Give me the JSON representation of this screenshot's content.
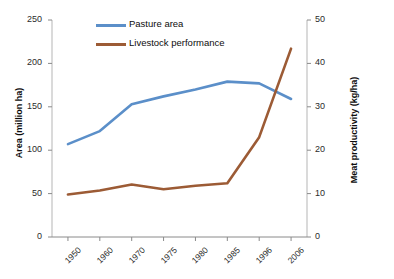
{
  "chart_data": {
    "type": "line",
    "title": "",
    "subtitle": "",
    "xlabel": "",
    "categories": [
      "1950",
      "1960",
      "1970",
      "1975",
      "1980",
      "1985",
      "1996",
      "2006"
    ],
    "grid": false,
    "legend_position": "top-center",
    "axes": {
      "left": {
        "label": "Area (million ha)",
        "ticks": [
          "0",
          "50",
          "100",
          "150",
          "200",
          "250"
        ],
        "min": 0,
        "max": 250,
        "step": 50
      },
      "right": {
        "label": "Meat productivity (kg/ha)",
        "ticks": [
          "0",
          "10",
          "20",
          "30",
          "40",
          "50"
        ],
        "min": 0,
        "max": 50,
        "step": 10
      }
    },
    "series": [
      {
        "name": "Pasture area",
        "axis": "left",
        "color": "#5B8FC9",
        "values": [
          107,
          122,
          153,
          162,
          170,
          179,
          177,
          159
        ]
      },
      {
        "name": "Livestock performance",
        "axis": "right",
        "color": "#9C5B35",
        "values": [
          9.8,
          10.7,
          12.1,
          11.0,
          11.8,
          12.4,
          23.0,
          43.4
        ]
      }
    ]
  },
  "legend": {
    "items": [
      {
        "label": "Pasture area",
        "color": "#5B8FC9"
      },
      {
        "label": "Livestock performance",
        "color": "#9C5B35"
      }
    ]
  },
  "ylabel_left": "Area (million ha)",
  "ylabel_right": "Meat productivity (kg/ha)"
}
